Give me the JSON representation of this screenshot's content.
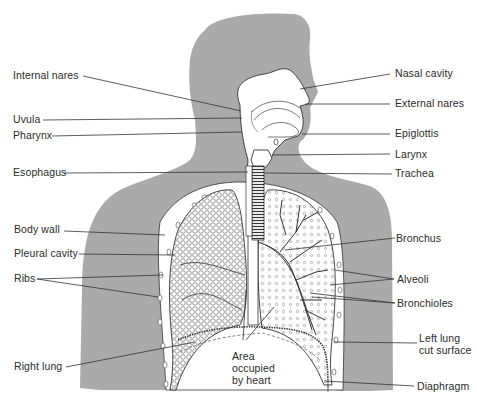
{
  "figure": {
    "colors": {
      "silhouette": "#aaaaaa",
      "line": "#333333",
      "background": "#ffffff",
      "tissue": "#ffffff"
    }
  },
  "labels_left": [
    {
      "id": "internal-nares",
      "text": "Internal nares"
    },
    {
      "id": "uvula",
      "text": "Uvula"
    },
    {
      "id": "pharynx",
      "text": "Pharynx"
    },
    {
      "id": "esophagus",
      "text": "Esophagus"
    },
    {
      "id": "body-wall",
      "text": "Body wall"
    },
    {
      "id": "pleural-cavity",
      "text": "Pleural cavity"
    },
    {
      "id": "ribs",
      "text": "Ribs"
    },
    {
      "id": "right-lung",
      "text": "Right lung"
    }
  ],
  "labels_right": [
    {
      "id": "nasal-cavity",
      "text": "Nasal cavity"
    },
    {
      "id": "external-nares",
      "text": "External nares"
    },
    {
      "id": "epiglottis",
      "text": "Epiglottis"
    },
    {
      "id": "larynx",
      "text": "Larynx"
    },
    {
      "id": "trachea",
      "text": "Trachea"
    },
    {
      "id": "bronchus",
      "text": "Bronchus"
    },
    {
      "id": "alveoli",
      "text": "Alveoli"
    },
    {
      "id": "bronchioles",
      "text": "Bronchioles"
    },
    {
      "id": "left-lung-cut-surface",
      "text": "Left lung\ncut surface"
    },
    {
      "id": "diaphragm",
      "text": "Diaphragm"
    }
  ],
  "labels_center": [
    {
      "id": "area-occupied-by-heart",
      "text": "Area\noccupied\nby heart"
    }
  ]
}
